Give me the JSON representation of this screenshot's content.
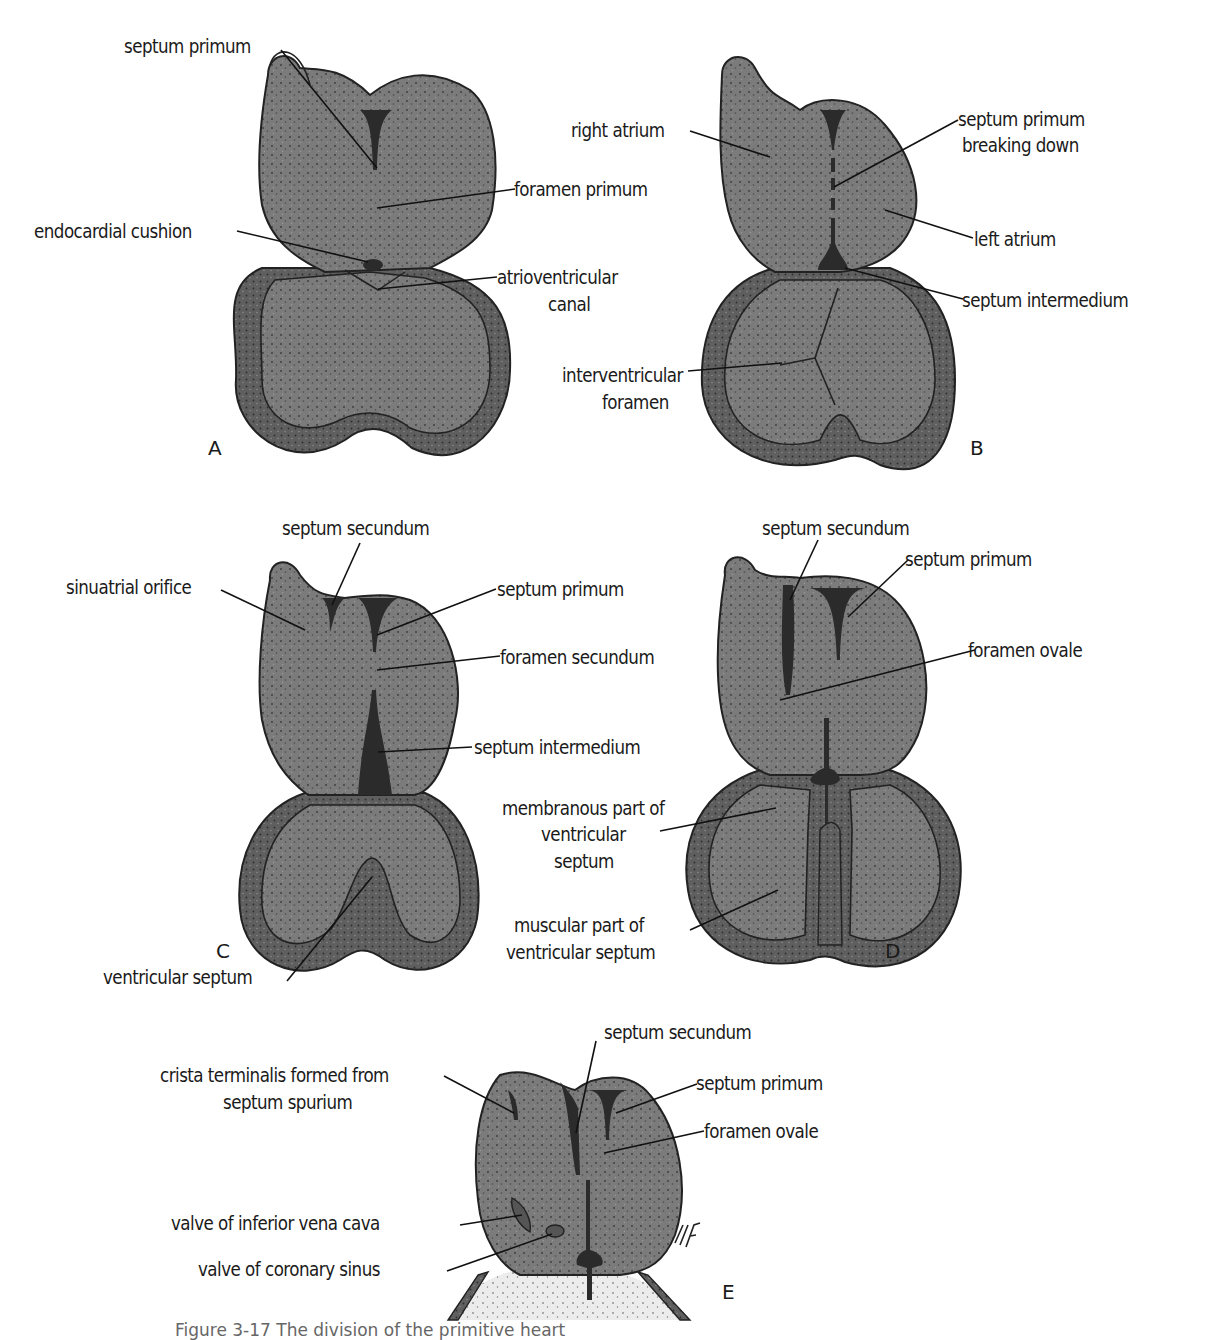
{
  "figure": {
    "caption": "Figure 3-17 The division of the primitive heart",
    "signature": "MF"
  },
  "colors": {
    "chamber_fill": "#7b7b7b",
    "wall_fill": "#5f5f5f",
    "septum_dark": "#2b2b2b",
    "outline": "#222222",
    "pericardium_fill": "#e9e9e9"
  },
  "panels": [
    {
      "id": "A",
      "letter": "A",
      "labels": [
        {
          "text": "septum primum"
        },
        {
          "text": "foramen primum"
        },
        {
          "text": "endocardial cushion"
        },
        {
          "text": "atrioventricular\ncanal",
          "lines": [
            "atrioventricular",
            "canal"
          ]
        }
      ]
    },
    {
      "id": "B",
      "letter": "B",
      "labels": [
        {
          "text": "right atrium"
        },
        {
          "text": "septum primum breaking down",
          "lines": [
            "septum primum",
            "breaking down"
          ]
        },
        {
          "text": "left atrium"
        },
        {
          "text": "septum intermedium"
        },
        {
          "text": "interventricular foramen",
          "lines": [
            "interventricular",
            "foramen"
          ]
        }
      ]
    },
    {
      "id": "C",
      "letter": "C",
      "labels": [
        {
          "text": "septum secundum"
        },
        {
          "text": "sinuatrial orifice"
        },
        {
          "text": "septum primum"
        },
        {
          "text": "foramen secundum"
        },
        {
          "text": "septum intermedium"
        },
        {
          "text": "ventricular septum"
        }
      ]
    },
    {
      "id": "D",
      "letter": "D",
      "labels": [
        {
          "text": "septum secundum"
        },
        {
          "text": "septum primum"
        },
        {
          "text": "foramen ovale"
        },
        {
          "text": "membranous part of ventricular septum",
          "lines": [
            "membranous part of",
            "ventricular",
            "septum"
          ]
        },
        {
          "text": "muscular part of ventricular septum",
          "lines": [
            "muscular part of",
            "ventricular septum"
          ]
        }
      ]
    },
    {
      "id": "E",
      "letter": "E",
      "labels": [
        {
          "text": "septum secundum"
        },
        {
          "text": "crista terminalis formed from septum spurium",
          "lines": [
            "crista terminalis formed from",
            "septum spurium"
          ]
        },
        {
          "text": "septum primum"
        },
        {
          "text": "foramen ovale"
        },
        {
          "text": "valve of inferior vena cava"
        },
        {
          "text": "valve of coronary sinus"
        }
      ]
    }
  ]
}
